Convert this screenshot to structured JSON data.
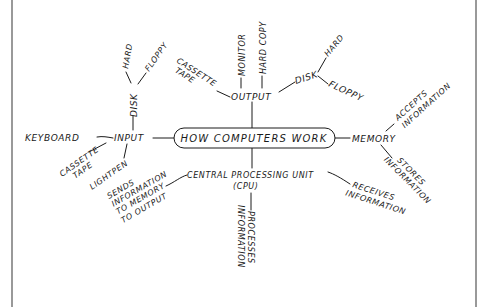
{
  "diagram": {
    "title": "How Computers Work",
    "center": {
      "label": "HOW COMPUTERS WORK"
    },
    "nodes": {
      "input": "INPUT",
      "keyboard": "KEYBOARD",
      "input_cassette_line1": "CASSETTE",
      "input_cassette_line2": "TAPE",
      "lightpen": "LIGHTPEN",
      "input_disk": "DISK",
      "input_disk_hard": "HARD",
      "input_disk_floppy": "FLOPPY",
      "output": "OUTPUT",
      "output_cassette_line1": "CASSETTE",
      "output_cassette_line2": "TAPE",
      "monitor": "MONITOR",
      "hard_copy": "HARD COPY",
      "output_disk": "DISK",
      "output_disk_hard": "HARD",
      "output_disk_floppy": "FLOPPY",
      "memory": "MEMORY",
      "accepts_line1": "ACCEPTS",
      "accepts_line2": "INFORMATION",
      "stores_line1": "STORES",
      "stores_line2": "INFORMATION",
      "cpu_line1": "CENTRAL PROCESSING UNIT",
      "cpu_line2": "(CPU)",
      "sends_line1": "SENDS",
      "sends_line2": "INFORMATION",
      "sends_line3": "TO MEMORY",
      "sends_line4": "TO OUTPUT",
      "processes_line1": "PROCESSES",
      "processes_line2": "INFORMATION",
      "receives_line1": "RECEIVES",
      "receives_line2": "INFORMATION"
    },
    "colors": {
      "ink": "#1a1a1a",
      "background": "#ffffff",
      "frame": "#555555"
    }
  }
}
